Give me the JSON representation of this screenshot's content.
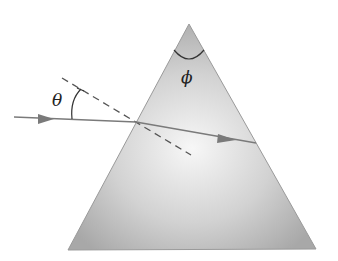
{
  "diagram": {
    "labels": {
      "incidence_angle": "θ",
      "apex_angle": "ϕ"
    },
    "colors": {
      "prism_light": "#f4f4f4",
      "prism_dark": "#a9a9a9",
      "prism_edge": "#8f8f8f",
      "ray": "#7a7a7a",
      "normal": "#555555",
      "arc": "#333333"
    },
    "elements": [
      "prism",
      "incident-ray",
      "refracted-ray",
      "normal-line",
      "incidence-angle-arc",
      "apex-angle-arc"
    ]
  }
}
